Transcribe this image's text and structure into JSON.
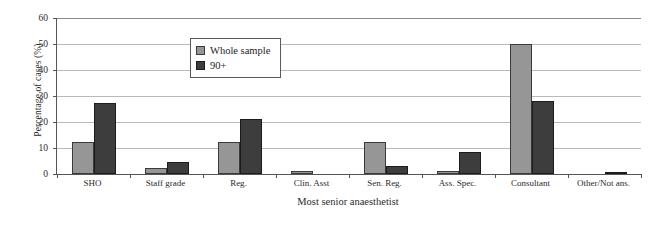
{
  "chart_data": {
    "type": "bar",
    "title": "",
    "xlabel": "Most senior anaesthetist",
    "ylabel": "Percentage of cases (%)",
    "categories": [
      "SHO",
      "Staff grade",
      "Reg.",
      "Clin. Asst",
      "Sen. Reg.",
      "Ass. Spec.",
      "Consultant",
      "Other/Not ans."
    ],
    "series": [
      {
        "name": "Whole sample",
        "color": "#969696",
        "values": [
          12.5,
          2.5,
          12.5,
          1.0,
          12.5,
          1.0,
          50.0,
          0.0
        ]
      },
      {
        "name": "90+",
        "color": "#3d3d3d",
        "values": [
          27.5,
          4.5,
          21.0,
          0.0,
          3.0,
          8.5,
          28.0,
          0.7
        ]
      }
    ],
    "ylim": [
      0,
      60
    ],
    "yticks": [
      0,
      10,
      20,
      30,
      40,
      50,
      60
    ],
    "ytick_labels": [
      "0",
      "10",
      "20",
      "30",
      "40",
      "50",
      "60"
    ],
    "grid": true,
    "legend_position": "upper-center"
  }
}
